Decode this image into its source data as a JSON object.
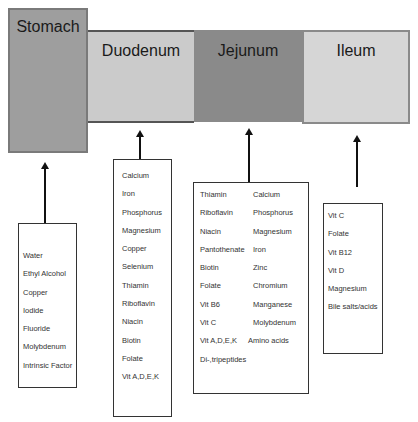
{
  "segments": {
    "stomach": {
      "label": "Stomach",
      "color": "#9e9e9e"
    },
    "duodenum": {
      "label": "Duodenum",
      "color": "#cbcbcb"
    },
    "jejunum": {
      "label": "Jejunum",
      "color": "#8a8a8a"
    },
    "ileum": {
      "label": "Ileum",
      "color": "#d6d6d6"
    }
  },
  "boxes": {
    "stomach": [
      "Water",
      "Ethyl Alcohol",
      "Copper",
      "Iodide",
      "Fluoride",
      "Molybdenum",
      "Intrinsic Factor"
    ],
    "duodenum": [
      "Calcium",
      "Iron",
      "Phosphorus",
      "Magnesium",
      "Copper",
      "Selenium",
      "Thiamin",
      "Riboflavin",
      "Niacin",
      "Biotin",
      "Folate",
      "Vit A,D,E,K"
    ],
    "jejunum": {
      "col_a": [
        "Thiamin",
        "Riboflavin",
        "Niacin",
        "Pantothenate",
        "Biotin",
        "Folate",
        "Vit B6",
        "Vit C",
        "Vit A,D,E,K",
        "Di-,tripeptides"
      ],
      "col_b": [
        "Calcium",
        "Phosphorus",
        "Magnesium",
        "Iron",
        "Zinc",
        "Chromium",
        "Manganese",
        "Molybdenum",
        "Amino acids"
      ]
    },
    "ileum": [
      "Vit C",
      "Folate",
      "Vit B12",
      "Vit D",
      "Magnesium",
      "Bile salts/acids"
    ]
  }
}
